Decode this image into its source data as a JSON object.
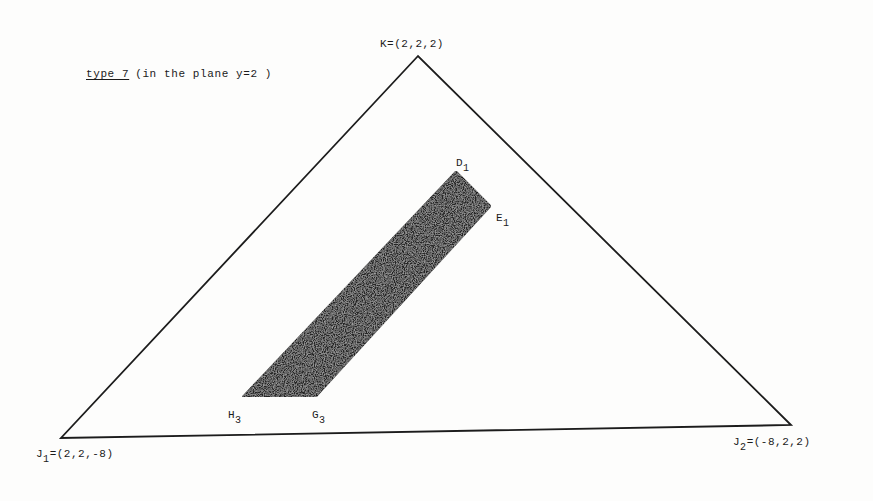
{
  "caption": {
    "type_label": "type 7",
    "description": "(in the plane  y=2 )"
  },
  "vertices": {
    "K": {
      "name": "K",
      "coords": "=(2,2,2)"
    },
    "J1": {
      "name": "J",
      "sub": "1",
      "coords": "=(2,2,-8)"
    },
    "J2": {
      "name": "J",
      "sub": "2",
      "coords": "=(-8,2,2)"
    }
  },
  "region_points": {
    "D1": {
      "name": "D",
      "sub": "1"
    },
    "E1": {
      "name": "E",
      "sub": "1"
    },
    "H3": {
      "name": "H",
      "sub": "3"
    },
    "G3": {
      "name": "G",
      "sub": "3"
    }
  },
  "colors": {
    "line": "#1c1c1c",
    "fill": "#262626",
    "background": "#fdfdfc"
  }
}
